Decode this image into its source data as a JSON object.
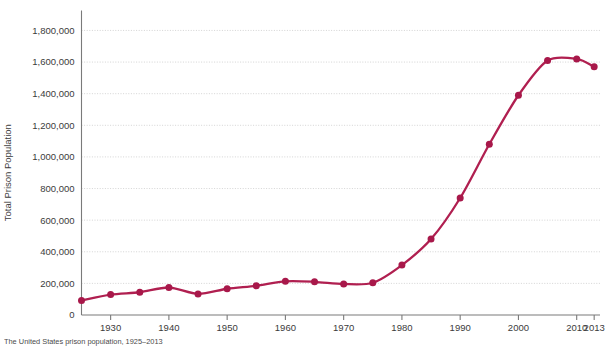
{
  "caption": "The United States prison population, 1925–2013",
  "chart_data": {
    "type": "line",
    "title": "",
    "xlabel": "",
    "ylabel": "Total Prison Population",
    "xlim": [
      1925,
      2014
    ],
    "ylim": [
      0,
      1880000
    ],
    "grid": true,
    "legend": "none",
    "line_color": "#b01f50",
    "marker_color": "#a8184a",
    "y_ticks": [
      0,
      200000,
      400000,
      600000,
      800000,
      1000000,
      1200000,
      1400000,
      1600000,
      1800000
    ],
    "y_tick_labels": [
      "0",
      "200,000",
      "400,000",
      "600,000",
      "800,000",
      "1,000,000",
      "1,200,000",
      "1,400,000",
      "1,600,000",
      "1,800,000"
    ],
    "x_ticks": [
      1930,
      1940,
      1950,
      1960,
      1970,
      1980,
      1990,
      2000,
      2010,
      2013
    ],
    "x_tick_labels": [
      "1930",
      "1940",
      "1950",
      "1960",
      "1970",
      "1980",
      "1990",
      "2000",
      "2010",
      "2013"
    ],
    "x": [
      1925,
      1930,
      1935,
      1940,
      1945,
      1950,
      1955,
      1960,
      1965,
      1970,
      1975,
      1980,
      1985,
      1990,
      1995,
      2000,
      2005,
      2010,
      2013
    ],
    "values": [
      92000,
      129000,
      144000,
      174000,
      133000,
      166000,
      185000,
      213000,
      210000,
      196000,
      204000,
      316000,
      480000,
      740000,
      1080000,
      1390000,
      1610000,
      1620000,
      1570000
    ],
    "series": [
      {
        "name": "Total Prison Population",
        "values": [
          92000,
          129000,
          144000,
          174000,
          133000,
          166000,
          185000,
          213000,
          210000,
          196000,
          204000,
          316000,
          480000,
          740000,
          1080000,
          1390000,
          1610000,
          1620000,
          1570000
        ]
      }
    ]
  }
}
